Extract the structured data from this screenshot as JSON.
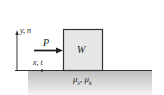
{
  "diagram": {
    "axis_labels": {
      "vertical": "y, n",
      "horizontal": "x, t"
    },
    "force_label": "P",
    "block_label": "W",
    "surface_label": "μ",
    "surface_sub_s": "s",
    "surface_sep": ", μ",
    "surface_sub_k": "k",
    "colors": {
      "block_fill": "#e6e6e6",
      "block_stroke": "#333333",
      "ground_fill": "#c8c8c8",
      "line": "#222222"
    }
  }
}
